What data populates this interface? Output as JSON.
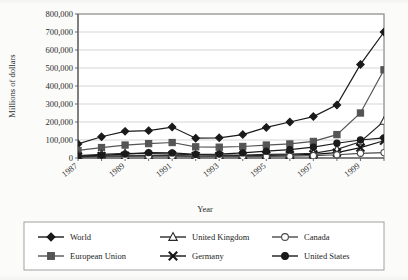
{
  "chart_data": {
    "type": "line",
    "title": "",
    "xlabel": "Year",
    "ylabel": "Millions of dollars",
    "x": [
      1987,
      1988,
      1989,
      1990,
      1991,
      1992,
      1993,
      1994,
      1995,
      1996,
      1997,
      1998,
      1999,
      2000
    ],
    "xtick_labels": [
      "1987",
      "1989",
      "1991",
      "1993",
      "1995",
      "1997",
      "1999"
    ],
    "xtick_values": [
      1987,
      1989,
      1991,
      1993,
      1995,
      1997,
      1999
    ],
    "ytick_labels": [
      "0",
      "100,000",
      "200,000",
      "300,000",
      "400,000",
      "500,000",
      "600,000",
      "700,000",
      "800,000"
    ],
    "ytick_values": [
      0,
      100000,
      200000,
      300000,
      400000,
      500000,
      600000,
      700000,
      800000
    ],
    "ylim": [
      0,
      800000
    ],
    "xlim": [
      1987,
      2000
    ],
    "grid": "horizontal",
    "legend_position": "bottom",
    "series": [
      {
        "name": "World",
        "marker": "filled-diamond",
        "color": "#1a1a1a",
        "values": [
          78000,
          118000,
          148000,
          152000,
          172000,
          110000,
          112000,
          130000,
          170000,
          200000,
          230000,
          295000,
          520000,
          700000
        ]
      },
      {
        "name": "European Union",
        "marker": "filled-square",
        "color": "#555555",
        "values": [
          42000,
          58000,
          72000,
          80000,
          86000,
          62000,
          60000,
          64000,
          72000,
          78000,
          92000,
          130000,
          250000,
          490000
        ]
      },
      {
        "name": "United Kingdom",
        "marker": "open-triangle",
        "color": "#2a2a2a",
        "values": [
          14000,
          20000,
          26000,
          24000,
          22000,
          18000,
          16000,
          16000,
          20000,
          22000,
          26000,
          48000,
          90000,
          205000
        ]
      },
      {
        "name": "Germany",
        "marker": "cross-x",
        "color": "#141414",
        "values": [
          8000,
          10000,
          12000,
          13000,
          14000,
          11000,
          10000,
          12000,
          14000,
          16000,
          20000,
          30000,
          58000,
          96000
        ]
      },
      {
        "name": "Canada",
        "marker": "open-circle",
        "color": "#4a4a4a",
        "values": [
          5000,
          7000,
          9000,
          10000,
          10000,
          8000,
          7000,
          8000,
          9000,
          10000,
          13000,
          18000,
          26000,
          30000
        ]
      },
      {
        "name": "United States",
        "marker": "filled-circle",
        "color": "#1a1a1a",
        "values": [
          10000,
          15000,
          22000,
          30000,
          28000,
          20000,
          22000,
          28000,
          38000,
          46000,
          60000,
          82000,
          100000,
          112000
        ]
      }
    ]
  },
  "legend": {
    "entries": [
      {
        "label": "World",
        "marker": "filled-diamond"
      },
      {
        "label": "European Union",
        "marker": "filled-square"
      },
      {
        "label": "United Kingdom",
        "marker": "open-triangle"
      },
      {
        "label": "Germany",
        "marker": "cross-x"
      },
      {
        "label": "Canada",
        "marker": "open-circle"
      },
      {
        "label": "United States",
        "marker": "filled-circle"
      }
    ]
  }
}
